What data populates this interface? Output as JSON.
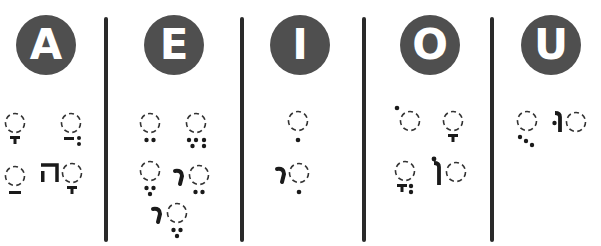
{
  "colors": {
    "circle_fill": "#4f4f4f",
    "circle_text": "#ffffff",
    "divider": "#2a2a2a",
    "marks": "#1a1a1a",
    "placeholder": "#333333"
  },
  "columns": [
    {
      "vowel": "A",
      "marks": [
        {
          "name": "qamats",
          "row": 1
        },
        {
          "name": "hataf-patah",
          "row": 1
        },
        {
          "name": "patah",
          "row": 2
        },
        {
          "name": "qamats-he",
          "row": 2,
          "letter": "ה"
        }
      ]
    },
    {
      "vowel": "E",
      "marks": [
        {
          "name": "tsere",
          "row": 1
        },
        {
          "name": "hataf-segol",
          "row": 1
        },
        {
          "name": "segol",
          "row": 2
        },
        {
          "name": "tsere-yod",
          "row": 2,
          "letter": "י"
        },
        {
          "name": "segol-yod",
          "row": 3,
          "letter": "י"
        }
      ]
    },
    {
      "vowel": "I",
      "marks": [
        {
          "name": "hiriq",
          "row": 1
        },
        {
          "name": "hiriq-yod",
          "row": 2,
          "letter": "י"
        }
      ]
    },
    {
      "vowel": "O",
      "marks": [
        {
          "name": "holam",
          "row": 1
        },
        {
          "name": "qamats-hatuf",
          "row": 1
        },
        {
          "name": "hataf-qamats",
          "row": 2
        },
        {
          "name": "holam-vav",
          "row": 2,
          "letter": "ו"
        }
      ]
    },
    {
      "vowel": "U",
      "marks": [
        {
          "name": "qubuts",
          "row": 1
        },
        {
          "name": "shuruq",
          "row": 1,
          "letter": "ו"
        }
      ]
    }
  ]
}
